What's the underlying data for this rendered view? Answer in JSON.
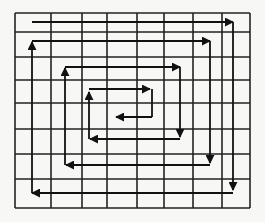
{
  "diagram": {
    "type": "spiral-traversal-grid",
    "colors": {
      "background": "#f7f7f5",
      "grid": "#222222",
      "path": "#111111"
    },
    "grid": {
      "columns": 8,
      "rows": 8,
      "x_lines": [
        15,
        51,
        82,
        107,
        137,
        164,
        193,
        222,
        250
      ],
      "y_lines": [
        13,
        32,
        57,
        80,
        103,
        129,
        154,
        179,
        208
      ]
    },
    "path_segments": [
      {
        "from": [
          32,
          22
        ],
        "to": [
          233,
          22
        ],
        "arrow": "right"
      },
      {
        "from": [
          233,
          22
        ],
        "to": [
          233,
          190
        ],
        "arrow": "down"
      },
      {
        "from": [
          233,
          193
        ],
        "to": [
          32,
          193
        ],
        "arrow": "left"
      },
      {
        "from": [
          32,
          193
        ],
        "to": [
          32,
          42
        ],
        "arrow": "up"
      },
      {
        "from": [
          32,
          41
        ],
        "to": [
          210,
          41
        ],
        "arrow": "right"
      },
      {
        "from": [
          210,
          41
        ],
        "to": [
          210,
          163
        ],
        "arrow": "down"
      },
      {
        "from": [
          210,
          165
        ],
        "to": [
          66,
          165
        ],
        "arrow": "left"
      },
      {
        "from": [
          65,
          165
        ],
        "to": [
          65,
          68
        ],
        "arrow": "up"
      },
      {
        "from": [
          65,
          67
        ],
        "to": [
          180,
          67
        ],
        "arrow": "right"
      },
      {
        "from": [
          180,
          67
        ],
        "to": [
          180,
          137
        ],
        "arrow": "down"
      },
      {
        "from": [
          180,
          139
        ],
        "to": [
          90,
          139
        ],
        "arrow": "left"
      },
      {
        "from": [
          89,
          139
        ],
        "to": [
          89,
          92
        ],
        "arrow": "up"
      },
      {
        "from": [
          89,
          89
        ],
        "to": [
          150,
          89
        ],
        "arrow": "right"
      },
      {
        "from": [
          152,
          89
        ],
        "to": [
          152,
          117
        ],
        "arrow": "none"
      },
      {
        "from": [
          152,
          117
        ],
        "to": [
          116,
          117
        ],
        "arrow": "left"
      }
    ]
  }
}
